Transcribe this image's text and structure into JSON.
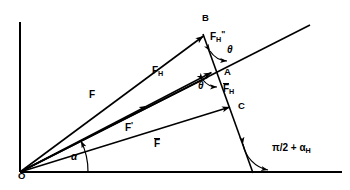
{
  "figure": {
    "background_color": "#ffffff",
    "line_color": "#000000",
    "width": 350,
    "height": 190
  },
  "points": {
    "origin": "O",
    "b": "B",
    "a": "A",
    "c": "C"
  },
  "vectors": {
    "f": "F",
    "f_h_base": "F",
    "f_h_sub": "H",
    "f_prime_base": "F",
    "f_prime_mark": "'",
    "f_bar": "F",
    "f_h_dblprime_base": "F",
    "f_h_dblprime_sub": "H",
    "f_h_dblprime_mark": "\"",
    "f_bar_h_base": "F",
    "f_bar_h_sub": "H"
  },
  "angles": {
    "alpha": "α",
    "theta_upper": "θ",
    "theta_lower": "θ",
    "pi_half_alpha_h_main": "π/2 + α",
    "pi_half_alpha_h_sub": "H"
  },
  "geometry": {
    "origin_xy": [
      20,
      172
    ],
    "y_axis_top_xy": [
      20,
      22
    ],
    "x_axis_right_xy": [
      340,
      172
    ],
    "ray_end_xy": [
      310,
      25
    ],
    "point_b_xy": [
      205,
      34
    ],
    "point_a_xy": [
      213,
      71
    ],
    "point_c_xy": [
      232,
      106
    ],
    "slant_bottom_xy": [
      253,
      172
    ]
  }
}
